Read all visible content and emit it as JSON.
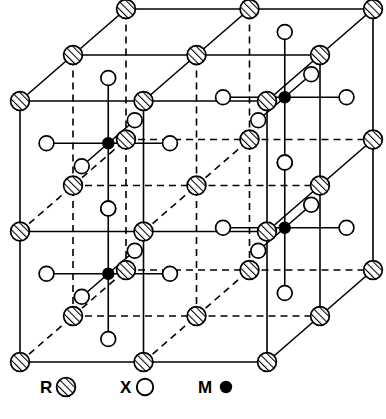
{
  "figure": {
    "colors": {
      "line": "#000000",
      "fill_open": "#ffffff",
      "fill_solid": "#000000",
      "hatch": "#000000",
      "background": "#ffffff"
    },
    "line_width": 1.6,
    "dash_pattern": "7,5"
  },
  "legend": {
    "items": [
      {
        "id": "R",
        "label": "R",
        "symbol": "hatched-circle",
        "symbol_name": "hatched-circle-icon",
        "radius": 9
      },
      {
        "id": "X",
        "label": "X",
        "symbol": "open-circle",
        "symbol_name": "open-circle-icon",
        "radius": 8
      },
      {
        "id": "M",
        "label": "M",
        "symbol": "filled-circle",
        "symbol_name": "filled-circle-icon",
        "radius": 6
      }
    ]
  },
  "caption": {
    "text": ""
  },
  "chart_data": {
    "type": "diagram",
    "projection": "oblique-cabinet",
    "cell_divisions": 2,
    "atom_radii": {
      "R": 9.5,
      "X": 7.5,
      "M": 5.5
    },
    "cube": {
      "origin_front_bottom_left": [
        20,
        362
      ],
      "x_step": 123.5,
      "y_step": 130.5,
      "depth_dx": 53,
      "depth_dy": -46
    },
    "R_sites_note": "R at all 27 nodes of the 3x3x3 grid of the doubled cell",
    "M_sites": [
      {
        "i": 0.5,
        "j": 1.5,
        "k": 0.5
      },
      {
        "i": 1.5,
        "j": 1.5,
        "k": 1.5
      },
      {
        "i": 0.5,
        "j": 0.5,
        "k": 0.5
      },
      {
        "i": 1.5,
        "j": 0.5,
        "k": 1.5
      }
    ],
    "X_per_M": 6,
    "X_coordination": "octahedral"
  }
}
